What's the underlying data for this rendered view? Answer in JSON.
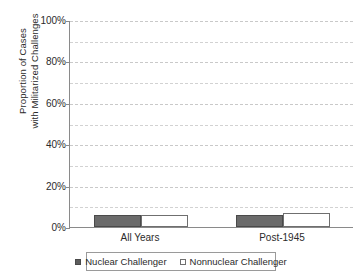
{
  "chart_data": {
    "type": "bar",
    "title": "",
    "xlabel": "",
    "ylabel": "Proportion of Cases\nwith Militarized Challenges",
    "categories": [
      "All Years",
      "Post-1945"
    ],
    "series": [
      {
        "name": "Nuclear Challenger",
        "values": [
          6,
          6
        ],
        "color": "#6b6b6b",
        "swatch": "filled"
      },
      {
        "name": "Nonnuclear Challenger",
        "values": [
          6,
          7
        ],
        "color": "#ffffff",
        "swatch": "open"
      }
    ],
    "ylim": [
      0,
      100
    ],
    "y_tick_values": [
      0,
      20,
      40,
      60,
      80,
      100
    ],
    "y_tick_labels": [
      "0%",
      "20%",
      "40%",
      "60%",
      "80%",
      "100%"
    ],
    "y_minor_tick_values": [
      10,
      30,
      50,
      70,
      90
    ],
    "grid": true,
    "grid_style": "dashed-horizontal",
    "legend_position": "bottom",
    "axis_color": "#8a8a8a",
    "grid_color": "#d2d2d2",
    "background": "#ffffff"
  },
  "y_axis": {
    "title_line1": "Proportion of Cases",
    "title_line2": "with Militarized Challenges",
    "ticks": [
      {
        "label": "100%",
        "value": 100
      },
      {
        "label": "80%",
        "value": 80
      },
      {
        "label": "60%",
        "value": 60
      },
      {
        "label": "40%",
        "value": 40
      },
      {
        "label": "20%",
        "value": 20
      },
      {
        "label": "0%",
        "value": 0
      }
    ]
  },
  "x_axis": {
    "categories": [
      {
        "label": "All Years"
      },
      {
        "label": "Post-1945"
      }
    ]
  },
  "legend": {
    "items": [
      {
        "label": "Nuclear Challenger",
        "swatch": "filled"
      },
      {
        "label": "Nonnuclear Challenger",
        "swatch": "open"
      }
    ]
  }
}
